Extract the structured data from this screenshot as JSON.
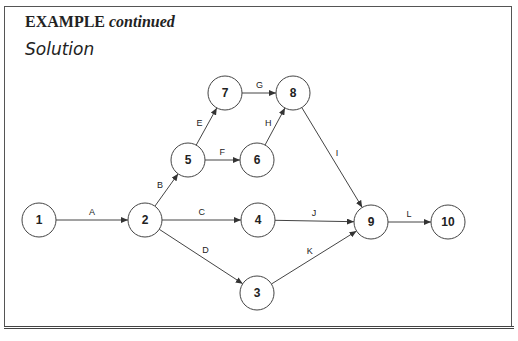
{
  "heading": {
    "prefix": "EXAMPLE",
    "suffix": "continued"
  },
  "subheading": "Solution",
  "network": {
    "nodes": [
      {
        "id": "1",
        "label": "1",
        "x": 39,
        "y": 220
      },
      {
        "id": "2",
        "label": "2",
        "x": 145,
        "y": 220
      },
      {
        "id": "3",
        "label": "3",
        "x": 257,
        "y": 293
      },
      {
        "id": "4",
        "label": "4",
        "x": 258,
        "y": 220
      },
      {
        "id": "5",
        "label": "5",
        "x": 188,
        "y": 160
      },
      {
        "id": "6",
        "label": "6",
        "x": 257,
        "y": 160
      },
      {
        "id": "7",
        "label": "7",
        "x": 225,
        "y": 93
      },
      {
        "id": "8",
        "label": "8",
        "x": 293,
        "y": 93
      },
      {
        "id": "9",
        "label": "9",
        "x": 371,
        "y": 222
      },
      {
        "id": "10",
        "label": "10",
        "x": 448,
        "y": 222
      }
    ],
    "edges": [
      {
        "label": "A",
        "from": "1",
        "to": "2"
      },
      {
        "label": "B",
        "from": "2",
        "to": "5"
      },
      {
        "label": "C",
        "from": "2",
        "to": "4"
      },
      {
        "label": "D",
        "from": "2",
        "to": "3"
      },
      {
        "label": "E",
        "from": "5",
        "to": "7"
      },
      {
        "label": "F",
        "from": "5",
        "to": "6"
      },
      {
        "label": "G",
        "from": "7",
        "to": "8"
      },
      {
        "label": "H",
        "from": "6",
        "to": "8"
      },
      {
        "label": "I",
        "from": "8",
        "to": "9"
      },
      {
        "label": "J",
        "from": "4",
        "to": "9"
      },
      {
        "label": "K",
        "from": "3",
        "to": "9"
      },
      {
        "label": "L",
        "from": "9",
        "to": "10"
      }
    ]
  }
}
